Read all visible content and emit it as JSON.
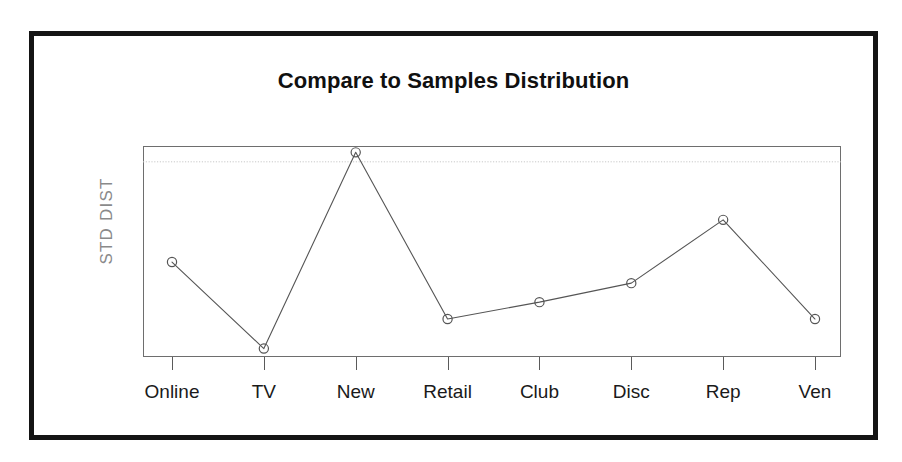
{
  "chart_data": {
    "type": "line",
    "title": "Compare to Samples Distribution",
    "xlabel": "",
    "ylabel": "STD DIST",
    "categories": [
      "Online",
      "TV",
      "New",
      "Retail",
      "Club",
      "Disc",
      "Rep",
      "Ven"
    ],
    "values": [
      0.45,
      0.04,
      0.97,
      0.18,
      0.26,
      0.35,
      0.65,
      0.18
    ],
    "series": [
      {
        "name": "STD DIST",
        "values": [
          0.45,
          0.04,
          0.97,
          0.18,
          0.26,
          0.35,
          0.65,
          0.18
        ]
      }
    ],
    "ylim": [
      0,
      1
    ],
    "y_tick_labels": [],
    "x_tick_labels": [
      "Online",
      "TV",
      "New",
      "Retail",
      "Club",
      "Disc",
      "Rep",
      "Ven"
    ],
    "grid": true,
    "gridlines": [
      {
        "orientation": "horizontal",
        "value": 0.925,
        "style": "dotted",
        "color": "#c8c8c8"
      }
    ],
    "legend": null,
    "legend_position": "none",
    "marker": "open-circle",
    "line_color": "#555555",
    "marker_color": "#555555",
    "annotations": []
  },
  "slide": {
    "border_color": "#141414",
    "background_color": "#ffffff",
    "plot_frame_color": "#6e6e6e"
  },
  "axis": {
    "y_title": "STD DIST",
    "y_title_color": "#8a8a8a",
    "tick_color": "#5a5a5a",
    "label_color": "#1a1a1a"
  }
}
